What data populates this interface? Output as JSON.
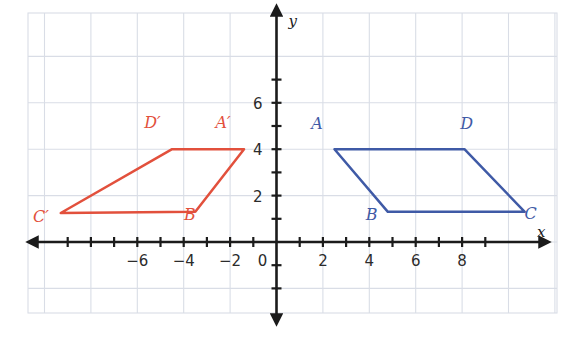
{
  "figure": {
    "title": "",
    "background_color": "#ffffff",
    "grid_color": "#d9dde6",
    "axis_color": "#1b1b1b",
    "blue_color": "#3f5aa6",
    "red_color": "#e2503c"
  },
  "axes": {
    "x_axis_label": "x",
    "y_axis_label": "y",
    "origin_label": "0",
    "x_ticks": [
      {
        "value": -6,
        "label": "−6"
      },
      {
        "value": -4,
        "label": "−4"
      },
      {
        "value": -2,
        "label": "−2"
      },
      {
        "value": 2,
        "label": "2"
      },
      {
        "value": 4,
        "label": "4"
      },
      {
        "value": 6,
        "label": "6"
      },
      {
        "value": 8,
        "label": "8"
      }
    ],
    "y_ticks": [
      {
        "value": 2,
        "label": "2"
      },
      {
        "value": 4,
        "label": "4"
      },
      {
        "value": 6,
        "label": "6"
      }
    ],
    "x_range": [
      -10.7,
      12.2
    ],
    "y_range": [
      -2.2,
      7.6
    ],
    "grid_step": 2,
    "unit_px": 23.2
  },
  "chart_data": {
    "type": "scatter",
    "title": "",
    "xlabel": "x",
    "ylabel": "y",
    "xlim": [
      -10.7,
      12.2
    ],
    "ylim": [
      -2.2,
      7.6
    ],
    "grid": true,
    "legend": "none",
    "shapes": [
      {
        "name": "parallelogram-abcd",
        "color": "#3f5aa6",
        "closed": true,
        "vertices": [
          {
            "label": "A",
            "x": 2.5,
            "y": 4.0,
            "label_dx": -0.75,
            "label_dy": 0.85
          },
          {
            "label": "B",
            "x": 4.8,
            "y": 1.3,
            "label_dx": -0.7,
            "label_dy": -0.35
          },
          {
            "label": "C",
            "x": 10.7,
            "y": 1.3,
            "label_dx": 0.25,
            "label_dy": -0.3
          },
          {
            "label": "D",
            "x": 8.1,
            "y": 4.0,
            "label_dx": 0.1,
            "label_dy": 0.85
          }
        ]
      },
      {
        "name": "parallelogram-a-prime-b-prime-c-prime-d-prime",
        "color": "#e2503c",
        "closed": true,
        "vertices": [
          {
            "label": "A′",
            "x": -1.4,
            "y": 4.0,
            "label_dx": -0.9,
            "label_dy": 0.9
          },
          {
            "label": "B′",
            "x": -3.5,
            "y": 1.3,
            "label_dx": -0.15,
            "label_dy": -0.35
          },
          {
            "label": "C′",
            "x": -9.3,
            "y": 1.25,
            "label_dx": -0.85,
            "label_dy": -0.4
          },
          {
            "label": "D′",
            "x": -4.5,
            "y": 4.0,
            "label_dx": -0.85,
            "label_dy": 0.9
          }
        ]
      }
    ]
  }
}
